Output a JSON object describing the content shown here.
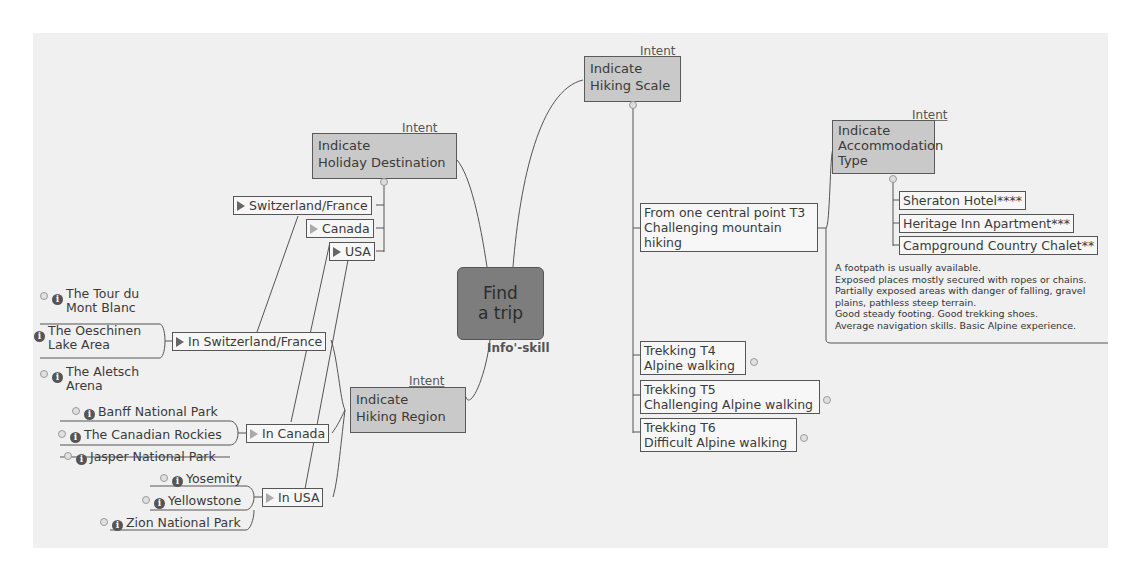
{
  "central": {
    "line1": "Find",
    "line2": "a trip",
    "tag": "Info'-skill"
  },
  "intent_label": "Intent",
  "holiday_destination": {
    "line1": "Indicate",
    "line2": "Holiday Destination",
    "children": [
      "Switzerland/France",
      "Canada",
      "USA"
    ]
  },
  "hiking_region": {
    "line1": "Indicate",
    "line2": "Hiking Region",
    "regions": [
      {
        "label": "In Switzerland/France",
        "places": [
          {
            "line1": "The Tour du",
            "line2": "Mont Blanc"
          },
          {
            "line1": "The Oeschinen",
            "line2": "Lake Area"
          },
          {
            "line1": "The Aletsch",
            "line2": "Arena"
          }
        ]
      },
      {
        "label": "In Canada",
        "places": [
          {
            "line1": "Banff National Park"
          },
          {
            "line1": "The Canadian Rockies"
          },
          {
            "line1": "Jasper National Park"
          }
        ]
      },
      {
        "label": "In USA",
        "places": [
          {
            "line1": "Yosemity"
          },
          {
            "line1": "Yellowstone"
          },
          {
            "line1": "Zion National Park"
          }
        ]
      }
    ]
  },
  "hiking_scale": {
    "line1": "Indicate",
    "line2": "Hiking Scale",
    "levels": [
      {
        "line1": "From one central point T3",
        "line2": "Challenging mountain",
        "line3": "hiking"
      },
      {
        "line1": "Trekking T4",
        "line2": "Alpine walking"
      },
      {
        "line1": "Trekking T5",
        "line2": "Challenging Alpine walking"
      },
      {
        "line1": "Trekking T6",
        "line2": "Difficult Alpine walking"
      }
    ]
  },
  "accommodation": {
    "line1": "Indicate",
    "line2": "Accommodation",
    "line3": "Type",
    "options": [
      "Sheraton Hotel****",
      "Heritage Inn Apartment***",
      "Campground Country Chalet**"
    ]
  },
  "t3_note": [
    "A footpath is usually available.",
    "Exposed places mostly secured with ropes or chains.",
    "Partially exposed areas with danger of falling, gravel",
    "plains, pathless steep terrain.",
    "Good steady footing. Good trekking shoes.",
    "Average navigation skills. Basic Alpine experience."
  ],
  "icons": {
    "info": "i"
  }
}
